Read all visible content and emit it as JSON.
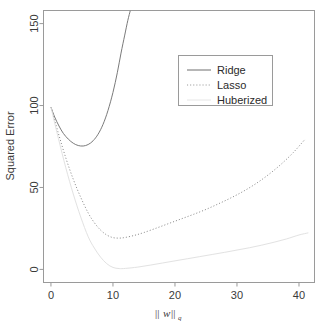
{
  "chart_data": {
    "type": "line",
    "title": "",
    "xlabel": "||w||q",
    "xlabel_parts": {
      "bars_left": "||",
      "variable": "w",
      "bars_right": "||",
      "subscript": "q"
    },
    "ylabel": "Squared Error",
    "xlim": [
      -1.2,
      42.5
    ],
    "ylim": [
      -8,
      158
    ],
    "xticks": [
      0,
      10,
      20,
      30,
      40
    ],
    "xticklabels": [
      "0",
      "10",
      "20",
      "30",
      "40"
    ],
    "yticks": [
      0,
      50,
      100,
      150
    ],
    "yticklabels": [
      "0",
      "50",
      "100",
      "150"
    ],
    "grid": false,
    "legend_position": "upper-center-right",
    "series": [
      {
        "name": "Ridge",
        "style": "solid",
        "color": "#7a7a7a",
        "x": [
          0,
          0.6,
          1.3,
          2.0,
          2.8,
          3.6,
          4.4,
          5.2,
          6.0,
          6.8,
          7.6,
          8.4,
          9.2,
          10.0,
          10.7,
          11.3,
          11.9,
          12.4,
          12.8
        ],
        "y": [
          99,
          93,
          87.5,
          83,
          79.5,
          77,
          75.6,
          75.3,
          76.2,
          78.5,
          82.5,
          88.5,
          97,
          108,
          120,
          132,
          143,
          152,
          158
        ]
      },
      {
        "name": "Lasso",
        "style": "dotted",
        "color": "#8f8f8f",
        "x": [
          0,
          1.2,
          2.4,
          3.6,
          4.8,
          6.0,
          7.0,
          8.0,
          9.0,
          10.0,
          11.0,
          12.0,
          13.5,
          15.0,
          17.0,
          19.0,
          21.0,
          23.0,
          25.0,
          27.0,
          29.0,
          31.0,
          33.0,
          35.0,
          37.0,
          39.0,
          41.0
        ],
        "y": [
          99,
          83,
          68,
          55,
          44,
          34.5,
          28.5,
          24,
          21,
          19.4,
          19.1,
          19.5,
          20.8,
          22.5,
          25.2,
          28.0,
          30.8,
          33.6,
          36.6,
          40.0,
          43.6,
          47.6,
          52.2,
          57.6,
          63.8,
          71.0,
          79.5
        ]
      },
      {
        "name": "Huberized",
        "style": "solid",
        "color": "#e2e2e2",
        "x": [
          0,
          1.2,
          2.4,
          3.6,
          4.8,
          6.0,
          7.0,
          8.0,
          9.0,
          10.0,
          11.0,
          12.0,
          14.0,
          16.0,
          18.0,
          20.0,
          22.0,
          24.0,
          26.0,
          28.0,
          30.0,
          32.0,
          34.0,
          36.0,
          38.0,
          40.0,
          41.5
        ],
        "y": [
          99,
          80,
          62,
          46,
          32,
          20,
          13,
          7.5,
          3.5,
          1.2,
          0.5,
          0.6,
          1.4,
          2.6,
          3.9,
          5.2,
          6.5,
          7.8,
          9.1,
          10.4,
          11.8,
          13.2,
          14.8,
          16.6,
          18.6,
          21.0,
          22.3
        ]
      }
    ],
    "legend": [
      {
        "label": "Ridge",
        "style": "solid",
        "color": "#6e6e6e"
      },
      {
        "label": "Lasso",
        "style": "dotted",
        "color": "#9a9a9a"
      },
      {
        "label": "Huberized",
        "style": "solid",
        "color": "#e6e6e6"
      }
    ]
  }
}
